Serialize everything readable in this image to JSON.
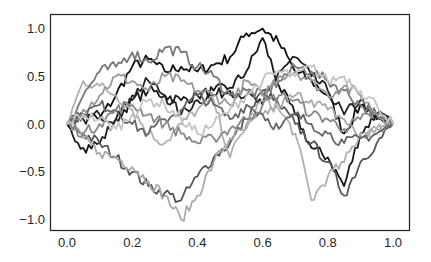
{
  "chart_data": {
    "type": "line",
    "title": "",
    "xlabel": "",
    "ylabel": "",
    "xlim": [
      -0.05,
      1.05
    ],
    "ylim": [
      -1.12,
      1.12
    ],
    "grid": false,
    "legend": null,
    "x_ticks": [
      0.0,
      0.2,
      0.4,
      0.6,
      0.8,
      1.0
    ],
    "x_tick_labels": [
      "0.0",
      "0.2",
      "0.4",
      "0.6",
      "0.8",
      "1.0"
    ],
    "y_ticks": [
      1.0,
      0.5,
      0.0,
      -0.5,
      -1.0
    ],
    "y_tick_labels": [
      "1.0",
      "0.5",
      "0.0",
      "−0.5",
      "−1.0"
    ],
    "x": [
      0.0,
      0.05,
      0.1,
      0.15,
      0.2,
      0.25,
      0.3,
      0.35,
      0.4,
      0.45,
      0.5,
      0.55,
      0.6,
      0.65,
      0.7,
      0.75,
      0.8,
      0.85,
      0.9,
      0.95,
      1.0
    ],
    "series": [
      {
        "name": "path-1",
        "color": "#111111",
        "values": [
          0.0,
          0.1,
          0.05,
          0.3,
          0.6,
          0.68,
          0.55,
          0.6,
          0.55,
          0.62,
          0.7,
          0.95,
          1.0,
          0.85,
          0.55,
          0.45,
          0.3,
          -0.1,
          0.2,
          0.1,
          0.0
        ]
      },
      {
        "name": "path-2",
        "color": "#1a1a1a",
        "values": [
          0.0,
          -0.25,
          -0.2,
          0.05,
          0.25,
          0.35,
          0.3,
          0.25,
          0.3,
          0.35,
          0.38,
          0.55,
          0.9,
          0.4,
          0.1,
          -0.25,
          -0.35,
          -0.65,
          -0.1,
          0.1,
          0.0
        ]
      },
      {
        "name": "path-3",
        "color": "#222222",
        "values": [
          0.0,
          0.05,
          0.1,
          0.05,
          0.3,
          0.45,
          0.3,
          0.1,
          0.25,
          0.3,
          0.35,
          0.3,
          0.2,
          0.55,
          0.7,
          0.5,
          0.35,
          0.1,
          0.25,
          0.05,
          0.0
        ]
      },
      {
        "name": "path-4",
        "color": "#555555",
        "values": [
          0.0,
          -0.1,
          -0.2,
          -0.35,
          -0.5,
          -0.65,
          -0.72,
          -0.8,
          -0.55,
          -0.35,
          -0.2,
          0.05,
          0.35,
          0.2,
          0.0,
          -0.2,
          -0.4,
          -0.75,
          -0.4,
          -0.2,
          0.0
        ]
      },
      {
        "name": "path-5",
        "color": "#aaaaaa",
        "values": [
          0.0,
          -0.15,
          -0.3,
          -0.35,
          -0.45,
          -0.6,
          -0.75,
          -1.0,
          -0.75,
          -0.4,
          -0.15,
          -0.05,
          0.1,
          0.2,
          0.3,
          0.25,
          0.15,
          0.05,
          -0.15,
          -0.05,
          0.0
        ]
      },
      {
        "name": "path-6",
        "color": "#b0b0b0",
        "values": [
          0.0,
          0.45,
          0.4,
          0.3,
          0.15,
          -0.1,
          -0.2,
          0.0,
          0.15,
          0.25,
          -0.35,
          0.0,
          0.25,
          0.15,
          -0.1,
          -0.8,
          -0.55,
          -0.4,
          -0.1,
          -0.05,
          0.0
        ]
      },
      {
        "name": "path-7",
        "color": "#777777",
        "values": [
          0.0,
          0.3,
          0.55,
          0.6,
          0.75,
          0.65,
          0.8,
          0.75,
          0.6,
          0.5,
          0.3,
          0.35,
          0.3,
          0.45,
          0.6,
          0.55,
          0.45,
          0.35,
          0.2,
          0.1,
          0.0
        ]
      },
      {
        "name": "path-8",
        "color": "#999999",
        "values": [
          0.0,
          0.15,
          0.3,
          0.5,
          0.45,
          0.35,
          0.5,
          0.45,
          0.35,
          0.3,
          0.2,
          0.45,
          0.3,
          0.5,
          0.55,
          0.45,
          0.3,
          0.4,
          0.3,
          0.1,
          0.0
        ]
      },
      {
        "name": "path-9",
        "color": "#666666",
        "values": [
          0.0,
          0.1,
          0.2,
          0.15,
          0.0,
          -0.1,
          0.05,
          0.15,
          0.3,
          0.2,
          0.05,
          0.2,
          0.1,
          -0.05,
          0.1,
          0.0,
          -0.1,
          -0.2,
          -0.15,
          -0.1,
          0.0
        ]
      },
      {
        "name": "path-10",
        "color": "#888888",
        "values": [
          0.0,
          -0.1,
          0.0,
          0.15,
          0.2,
          0.1,
          0.0,
          -0.1,
          -0.2,
          -0.15,
          -0.05,
          0.05,
          0.2,
          0.3,
          0.25,
          0.1,
          0.05,
          -0.05,
          0.05,
          0.1,
          0.0
        ]
      },
      {
        "name": "path-11",
        "color": "#c4c4c4",
        "values": [
          0.0,
          0.1,
          0.05,
          -0.05,
          0.1,
          0.25,
          0.2,
          0.05,
          -0.1,
          0.0,
          0.15,
          0.3,
          0.45,
          0.55,
          0.5,
          0.6,
          0.45,
          0.5,
          0.35,
          0.2,
          0.0
        ]
      }
    ]
  }
}
